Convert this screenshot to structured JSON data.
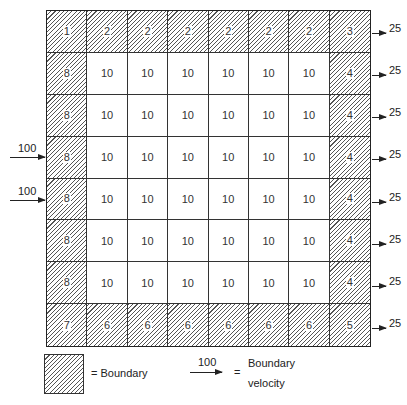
{
  "diagram": {
    "grid": {
      "rows": 8,
      "cols": 8,
      "cells": [
        [
          {
            "v": "1",
            "b": true
          },
          {
            "v": "2",
            "b": true
          },
          {
            "v": "2",
            "b": true
          },
          {
            "v": "2",
            "b": true
          },
          {
            "v": "2",
            "b": true
          },
          {
            "v": "2",
            "b": true
          },
          {
            "v": "2",
            "b": true
          },
          {
            "v": "3",
            "b": true
          }
        ],
        [
          {
            "v": "8",
            "b": true
          },
          {
            "v": "10",
            "b": false
          },
          {
            "v": "10",
            "b": false
          },
          {
            "v": "10",
            "b": false
          },
          {
            "v": "10",
            "b": false
          },
          {
            "v": "10",
            "b": false
          },
          {
            "v": "10",
            "b": false
          },
          {
            "v": "4",
            "b": true
          }
        ],
        [
          {
            "v": "8",
            "b": true
          },
          {
            "v": "10",
            "b": false
          },
          {
            "v": "10",
            "b": false
          },
          {
            "v": "10",
            "b": false
          },
          {
            "v": "10",
            "b": false
          },
          {
            "v": "10",
            "b": false
          },
          {
            "v": "10",
            "b": false
          },
          {
            "v": "4",
            "b": true
          }
        ],
        [
          {
            "v": "8",
            "b": true
          },
          {
            "v": "10",
            "b": false
          },
          {
            "v": "10",
            "b": false
          },
          {
            "v": "10",
            "b": false
          },
          {
            "v": "10",
            "b": false
          },
          {
            "v": "10",
            "b": false
          },
          {
            "v": "10",
            "b": false
          },
          {
            "v": "4",
            "b": true
          }
        ],
        [
          {
            "v": "8",
            "b": true
          },
          {
            "v": "10",
            "b": false
          },
          {
            "v": "10",
            "b": false
          },
          {
            "v": "10",
            "b": false
          },
          {
            "v": "10",
            "b": false
          },
          {
            "v": "10",
            "b": false
          },
          {
            "v": "10",
            "b": false
          },
          {
            "v": "4",
            "b": true
          }
        ],
        [
          {
            "v": "8",
            "b": true
          },
          {
            "v": "10",
            "b": false
          },
          {
            "v": "10",
            "b": false
          },
          {
            "v": "10",
            "b": false
          },
          {
            "v": "10",
            "b": false
          },
          {
            "v": "10",
            "b": false
          },
          {
            "v": "10",
            "b": false
          },
          {
            "v": "4",
            "b": true
          }
        ],
        [
          {
            "v": "8",
            "b": true
          },
          {
            "v": "10",
            "b": false
          },
          {
            "v": "10",
            "b": false
          },
          {
            "v": "10",
            "b": false
          },
          {
            "v": "10",
            "b": false
          },
          {
            "v": "10",
            "b": false
          },
          {
            "v": "10",
            "b": false
          },
          {
            "v": "4",
            "b": true
          }
        ],
        [
          {
            "v": "7",
            "b": true
          },
          {
            "v": "6",
            "b": true
          },
          {
            "v": "6",
            "b": true
          },
          {
            "v": "6",
            "b": true
          },
          {
            "v": "6",
            "b": true
          },
          {
            "v": "6",
            "b": true
          },
          {
            "v": "6",
            "b": true
          },
          {
            "v": "5",
            "b": true
          }
        ]
      ]
    },
    "inflow_arrows": [
      {
        "label": "100",
        "row": 3
      },
      {
        "label": "100",
        "row": 4
      }
    ],
    "outflow_arrows": [
      {
        "label": "25",
        "row": 0
      },
      {
        "label": "25",
        "row": 1
      },
      {
        "label": "25",
        "row": 2
      },
      {
        "label": "25",
        "row": 3
      },
      {
        "label": "25",
        "row": 4
      },
      {
        "label": "25",
        "row": 5
      },
      {
        "label": "25",
        "row": 6
      },
      {
        "label": "25",
        "row": 7
      }
    ],
    "legend": {
      "boundary_label": "= Boundary",
      "velocity_sample": "100",
      "velocity_equals": "=",
      "velocity_label_line1": "Boundary",
      "velocity_label_line2": "velocity"
    }
  }
}
